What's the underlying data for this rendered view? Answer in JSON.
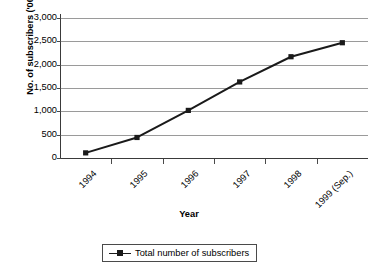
{
  "chart_data": {
    "type": "line",
    "title": "",
    "xlabel": "Year",
    "ylabel": "No. of subscribers ('000)",
    "categories": [
      "1994",
      "1995",
      "1996",
      "1997",
      "1998",
      "1999 (Sep.)"
    ],
    "values": [
      110,
      440,
      1020,
      1630,
      2170,
      2470
    ],
    "series": [
      {
        "name": "Total number of subscribers",
        "values": [
          110,
          440,
          1020,
          1630,
          2170,
          2470
        ]
      }
    ],
    "ylim": [
      0,
      3000
    ],
    "ytick_labels": [
      "0",
      "500",
      "1,000",
      "1,500",
      "2,000",
      "2,500",
      "3,000"
    ],
    "ytick_values": [
      0,
      500,
      1000,
      1500,
      2000,
      2500,
      3000
    ],
    "grid": "horizontal",
    "legend_position": "bottom",
    "legend_entries": [
      "Total number of subscribers"
    ],
    "marker": "square",
    "line_color": "#1a1a1a",
    "grid_color": "#9a9a9a",
    "axis_color": "#3a3a3a",
    "background_color": "#ffffff"
  },
  "axes": {
    "y_title": "No. of subscribers ('000)",
    "x_title": "Year"
  },
  "legend": {
    "entry_label": "Total number of subscribers"
  }
}
